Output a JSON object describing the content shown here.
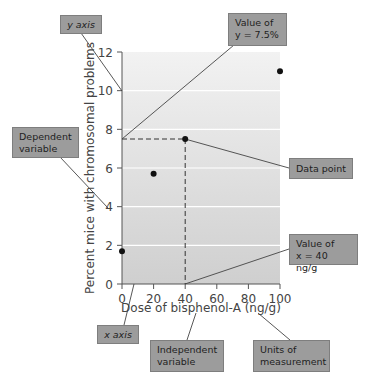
{
  "chart_data": {
    "type": "scatter",
    "title": "",
    "xlabel": "Dose of bisphenol-A (ng/g)",
    "ylabel": "Percent mice with chromosomal problems",
    "x": [
      0,
      20,
      40,
      100
    ],
    "values": [
      1.7,
      5.7,
      7.5,
      11.0
    ],
    "xlim": [
      0,
      100
    ],
    "ylim": [
      0,
      12
    ],
    "x_ticks": [
      0,
      20,
      40,
      60,
      80,
      100
    ],
    "y_ticks": [
      0,
      2,
      4,
      6,
      8,
      10,
      12
    ],
    "grid": "horizontal",
    "legend": null,
    "annotations": [
      {
        "text": "y axis",
        "target": "y-axis"
      },
      {
        "text": "Value of y = 7.5%",
        "target": "y=7.5 on y-axis"
      },
      {
        "text": "Dependent variable",
        "target": "y-axis label"
      },
      {
        "text": "Data point",
        "target": "(40, 7.5)"
      },
      {
        "text": "Value of x = 40 ng/g",
        "target": "x=40 on x-axis"
      },
      {
        "text": "x axis",
        "target": "x-axis"
      },
      {
        "text": "Independent variable",
        "target": "x-axis label"
      },
      {
        "text": "Units of measurement",
        "target": "(ng/g)"
      }
    ],
    "highlight": {
      "x": 40,
      "y": 7.5,
      "style": "dashed guide lines"
    }
  },
  "colors": {
    "plot_gradient_top": "#f2f2f2",
    "plot_gradient_bottom": "#cfcfcf",
    "gridline": "#ffffff",
    "axis": "#555555",
    "point": "#111111",
    "callout_fill": "#9c9c9c",
    "callout_border": "#7e7e7e"
  },
  "callouts": {
    "y_axis": {
      "line1": "y axis"
    },
    "value_y": {
      "line1": "Value of",
      "line2": "y = 7.5%"
    },
    "dependent": {
      "line1": "Dependent",
      "line2": "variable"
    },
    "data_point": {
      "line1": "Data point"
    },
    "value_x": {
      "line1": "Value of",
      "line2": "x = 40 ng/g"
    },
    "x_axis": {
      "line1": "x axis"
    },
    "independent": {
      "line1": "Independent",
      "line2": "variable"
    },
    "units": {
      "line1": "Units of",
      "line2": "measurement"
    }
  }
}
